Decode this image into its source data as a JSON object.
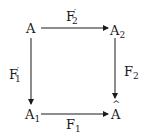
{
  "diagram": {
    "type": "commutative-square",
    "nodes": {
      "top_left": {
        "base": "A",
        "sub": ""
      },
      "top_right": {
        "base": "A",
        "sub": "2"
      },
      "bottom_left": {
        "base": "A",
        "sub": "1"
      },
      "bottom_right": {
        "base": "A",
        "accent": "hat"
      }
    },
    "arrows": {
      "top": {
        "from": "A",
        "to": "A2",
        "label_base": "F",
        "label_sub": "2",
        "label_prime": "′"
      },
      "left": {
        "from": "A",
        "to": "A1",
        "label_base": "F",
        "label_sub": "1",
        "label_prime": "′"
      },
      "right": {
        "from": "A2",
        "to": "Â",
        "label_base": "F",
        "label_sub": "2"
      },
      "bottom": {
        "from": "A1",
        "to": "Â",
        "label_base": "F",
        "label_sub": "1"
      }
    }
  }
}
